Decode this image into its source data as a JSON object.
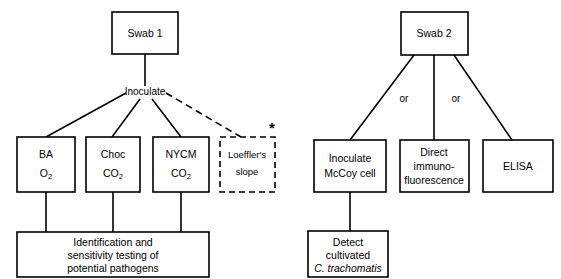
{
  "diagram": {
    "background_color": "#ffffff",
    "line_color": "#000000",
    "left_branch": {
      "root": {
        "label": "Swab 1"
      },
      "edge_label": "Inoculate",
      "media": [
        {
          "line1": "BA",
          "line2_base": "O",
          "line2_sub": "2",
          "dashed": false
        },
        {
          "line1": "Choc",
          "line2_base": "CO",
          "line2_sub": "2",
          "dashed": false
        },
        {
          "line1": "NYCM",
          "line2_base": "CO",
          "line2_sub": "2",
          "dashed": false
        }
      ],
      "optional": {
        "line1": "Loeffler's",
        "line2": "slope",
        "dashed": true,
        "marker": "*"
      },
      "outcome": {
        "line1": "Identification and",
        "line2": "sensitivity testing of",
        "line3": "potential pathogens"
      }
    },
    "right_branch": {
      "root": {
        "label": "Swab 2"
      },
      "edge_labels": [
        "or",
        "or"
      ],
      "methods": [
        {
          "line1": "Inoculate",
          "line2": "McCoy cell",
          "line3": ""
        },
        {
          "line1": "Direct",
          "line2": "immuno-",
          "line3": "fluorescence"
        },
        {
          "line1": "ELISA",
          "line2": "",
          "line3": ""
        }
      ],
      "result": {
        "line1": "Detect",
        "line2": "cultivated",
        "line3": "C. trachomatis",
        "line3_italic": true
      }
    }
  }
}
